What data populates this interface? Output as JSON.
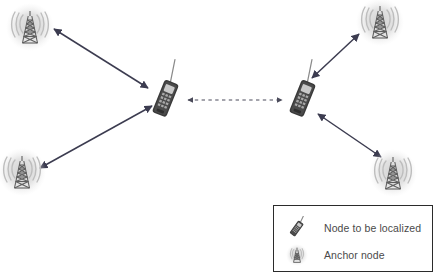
{
  "figure": {
    "type": "network-localization-diagram",
    "background_color": "#ffffff",
    "title": ""
  },
  "legend": {
    "border_color": "#2b2b2b",
    "background_color": "#ffffff",
    "text_color": "#4a4a4a",
    "items": [
      {
        "icon": "cell-phone-icon",
        "label": "Node to be localized"
      },
      {
        "icon": "radio-tower-icon",
        "label": "Anchor node"
      }
    ]
  },
  "nodes": {
    "anchors": [
      {
        "id": "anchor-top-left",
        "icon": "radio-tower-icon",
        "x": 30,
        "y": 27,
        "label": ""
      },
      {
        "id": "anchor-top-right",
        "icon": "radio-tower-icon",
        "x": 380,
        "y": 22,
        "label": ""
      },
      {
        "id": "anchor-bottom-left",
        "icon": "radio-tower-icon",
        "x": 22,
        "y": 172,
        "label": ""
      },
      {
        "id": "anchor-bottom-right",
        "icon": "radio-tower-icon",
        "x": 393,
        "y": 173,
        "label": ""
      }
    ],
    "targets": [
      {
        "id": "node-left",
        "icon": "cell-phone-icon",
        "x": 166,
        "y": 97,
        "label": ""
      },
      {
        "id": "node-right",
        "icon": "cell-phone-icon",
        "x": 303,
        "y": 97,
        "label": ""
      }
    ]
  },
  "links": [
    {
      "id": "link-node-left-anchor-top-left",
      "style": "solid",
      "arrows": "both",
      "x1": 148,
      "y1": 88,
      "x2": 54,
      "y2": 29,
      "color": "#3c3c50"
    },
    {
      "id": "link-node-left-anchor-bottom-left",
      "style": "solid",
      "arrows": "both",
      "x1": 152,
      "y1": 106,
      "x2": 40,
      "y2": 168,
      "color": "#3c3c50"
    },
    {
      "id": "link-node-right-anchor-top-right",
      "style": "solid",
      "arrows": "both",
      "x1": 312,
      "y1": 78,
      "x2": 359,
      "y2": 34,
      "color": "#3c3c50"
    },
    {
      "id": "link-node-right-anchor-bottom-right",
      "style": "solid",
      "arrows": "both",
      "x1": 318,
      "y1": 114,
      "x2": 381,
      "y2": 157,
      "color": "#3c3c50"
    },
    {
      "id": "link-node-left-node-right",
      "style": "dashed",
      "arrows": "both",
      "x1": 188,
      "y1": 100,
      "x2": 282,
      "y2": 100,
      "color": "#4a4a5a"
    }
  ],
  "colors": {
    "arrow": "#3c3c50",
    "dashed_arrow": "#4a4a5a",
    "tower_body": "#6f6f6f",
    "tower_halo": "#d8d8d8",
    "phone_body": "#3a3a3a",
    "phone_keypad": "#9a9a9a"
  }
}
